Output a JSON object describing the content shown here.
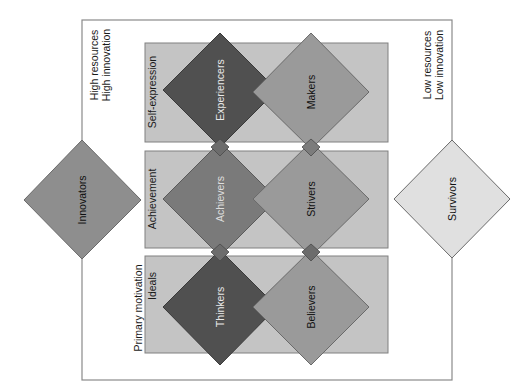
{
  "diagram": {
    "corner_labels": {
      "top_left": [
        "High resources",
        "High innovation"
      ],
      "top_right": [
        "Low resources",
        "Low innovation"
      ]
    },
    "axis_label": "Primary motivation",
    "rows": [
      {
        "label": "Self-expression",
        "left": "Experiencers",
        "right": "Makers"
      },
      {
        "label": "Achievement",
        "left": "Achievers",
        "right": "Strivers"
      },
      {
        "label": "Ideals",
        "left": "Thinkers",
        "right": "Believers"
      }
    ],
    "extremes": {
      "high": "Innovators",
      "low": "Survivors"
    },
    "colors": {
      "row_band": "#c4c4c4",
      "row_band_border": "#808080",
      "high_resource_diamond": "#505050",
      "left_middle_diamond": "#7a7a7a",
      "right_diamond": "#9a9a9a",
      "innovators": "#8e8e8e",
      "survivors": "#e0e0e0",
      "frame": "#8a8a8a",
      "connector": "#6c6c6c"
    }
  }
}
